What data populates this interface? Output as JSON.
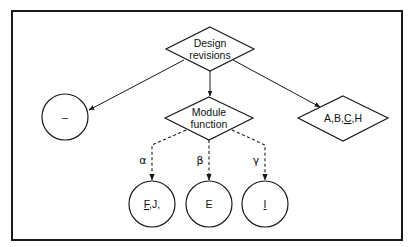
{
  "diagram": {
    "nodes": {
      "design_revisions": {
        "shape": "diamond",
        "line1": "Design",
        "line2": "revisions"
      },
      "module_function": {
        "shape": "diamond",
        "line1": "Module",
        "line2": "function"
      },
      "abch": {
        "shape": "diamond",
        "label_pre": "A,B,",
        "label_underlined": "C",
        "label_post": ",H"
      },
      "dash_circle": {
        "shape": "circle",
        "label": "–"
      },
      "fj_circle": {
        "shape": "circle",
        "label_underlined": "F",
        "label_post": ",J,"
      },
      "e_circle": {
        "shape": "circle",
        "label": "E"
      },
      "i_circle": {
        "shape": "circle",
        "label_underlined": "I"
      }
    },
    "edges": [
      {
        "from": "design_revisions",
        "to": "dash_circle",
        "style": "solid"
      },
      {
        "from": "design_revisions",
        "to": "module_function",
        "style": "solid"
      },
      {
        "from": "design_revisions",
        "to": "abch",
        "style": "solid"
      },
      {
        "from": "module_function",
        "to": "fj_circle",
        "style": "dashed",
        "label": "α"
      },
      {
        "from": "module_function",
        "to": "e_circle",
        "style": "dashed",
        "label": "β"
      },
      {
        "from": "module_function",
        "to": "i_circle",
        "style": "dashed",
        "label": "γ"
      }
    ],
    "edge_labels": {
      "alpha": "α",
      "beta": "β",
      "gamma": "γ"
    }
  }
}
